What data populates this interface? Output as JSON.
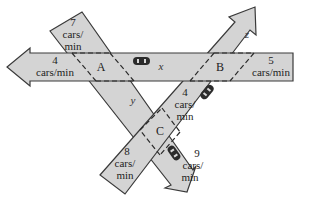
{
  "diagram": {
    "nodes": [
      {
        "id": "A",
        "label": "A"
      },
      {
        "id": "B",
        "label": "B"
      },
      {
        "id": "C",
        "label": "C"
      }
    ],
    "variables": {
      "x": "x",
      "y": "y",
      "z": "z"
    },
    "flows": {
      "a_in_top": {
        "num": "7",
        "unit1": "cars/",
        "unit2": "min"
      },
      "a_out_left": {
        "num": "4",
        "unit": "cars/min"
      },
      "b_in_right": {
        "num": "5",
        "unit": "cars/min"
      },
      "bc_mid": {
        "num": "4",
        "unit1": "cars/",
        "unit2": "min"
      },
      "c_in_bottom": {
        "num": "8",
        "unit1": "cars/",
        "unit2": "min"
      },
      "c_out_bottom_right": {
        "num": "9",
        "unit1": "cars/",
        "unit2": "min"
      }
    },
    "colors": {
      "road": "#d4d4d4",
      "outline": "#3a3a3a",
      "car": "#2b2b2b"
    }
  }
}
